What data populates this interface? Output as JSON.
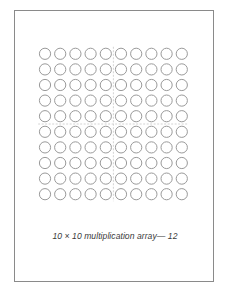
{
  "figure": {
    "caption": "10 × 10 multiplication array— 12",
    "rows": 10,
    "columns": 10,
    "item_shape": "circle",
    "divider_after_column": 5,
    "divider_after_row": 5,
    "colors": {
      "circle_stroke": "#9a9a9a",
      "divider": "#c8c8c8",
      "frame": "#8a8a8a",
      "caption": "#3a3a3a",
      "background": "#ffffff"
    }
  }
}
